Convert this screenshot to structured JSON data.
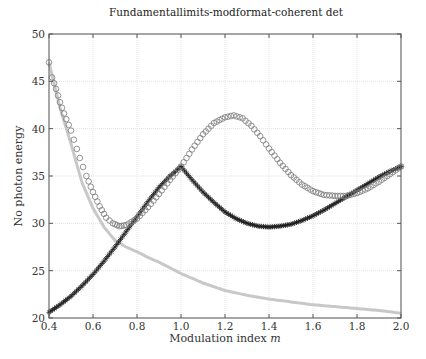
{
  "chart_data": {
    "type": "line",
    "title": "Fundamentallimits-modformat-coherent det",
    "xlabel": "Modulation index m",
    "xlabel_parts": {
      "text": "Modulation index ",
      "italic": "m"
    },
    "ylabel": "No photon energy",
    "xlim": [
      0.4,
      2.0
    ],
    "ylim": [
      20,
      50
    ],
    "xticks": [
      "0.4",
      "0.6",
      "0.8",
      "1.0",
      "1.2",
      "1.4",
      "1.6",
      "1.8",
      "2.0"
    ],
    "yticks": [
      "20",
      "25",
      "30",
      "35",
      "40",
      "45",
      "50"
    ],
    "grid": true,
    "legend": null,
    "series": [
      {
        "name": "circles (gray, open circle markers)",
        "marker": "circle",
        "color": "#7a7a7a",
        "x": [
          0.4,
          0.414,
          0.432,
          0.45,
          0.468,
          0.5,
          0.54,
          0.57,
          0.6,
          0.63,
          0.66,
          0.69,
          0.72,
          0.75,
          0.8,
          0.85,
          0.9,
          0.95,
          1.0,
          1.05,
          1.1,
          1.15,
          1.2,
          1.24,
          1.28,
          1.32,
          1.36,
          1.4,
          1.45,
          1.5,
          1.55,
          1.6,
          1.65,
          1.7,
          1.75,
          1.8,
          1.85,
          1.9,
          1.95,
          2.0
        ],
        "y": [
          47.0,
          45.4,
          44.2,
          42.8,
          41.6,
          39.8,
          36.9,
          35.0,
          33.3,
          31.8,
          30.6,
          30.0,
          29.7,
          29.8,
          30.5,
          31.7,
          33.1,
          34.6,
          36.0,
          37.8,
          39.4,
          40.6,
          41.2,
          41.4,
          41.1,
          40.3,
          39.2,
          37.9,
          36.4,
          35.1,
          34.1,
          33.4,
          33.0,
          32.9,
          32.9,
          33.2,
          33.7,
          34.4,
          35.2,
          36.0
        ]
      },
      {
        "name": "asterisks (black)",
        "marker": "asterisk",
        "color": "#1a1a1a",
        "x": [
          0.4,
          0.45,
          0.5,
          0.55,
          0.6,
          0.65,
          0.7,
          0.75,
          0.8,
          0.85,
          0.9,
          0.95,
          1.0,
          1.05,
          1.1,
          1.15,
          1.2,
          1.25,
          1.3,
          1.35,
          1.4,
          1.45,
          1.5,
          1.55,
          1.6,
          1.65,
          1.7,
          1.75,
          1.8,
          1.85,
          1.9,
          1.95,
          2.0
        ],
        "y": [
          20.6,
          21.4,
          22.3,
          23.4,
          24.6,
          26.0,
          27.5,
          29.1,
          30.7,
          32.3,
          33.8,
          35.0,
          36.0,
          34.6,
          33.3,
          32.2,
          31.2,
          30.5,
          30.0,
          29.7,
          29.6,
          29.7,
          29.9,
          30.3,
          30.8,
          31.4,
          32.1,
          32.8,
          33.5,
          34.2,
          34.9,
          35.5,
          36.0
        ]
      },
      {
        "name": "light gray line",
        "marker": "dot",
        "color": "#c8c8c8",
        "x": [
          0.4,
          0.45,
          0.5,
          0.55,
          0.6,
          0.65,
          0.7,
          0.75,
          0.8,
          0.85,
          0.9,
          1.0,
          1.1,
          1.2,
          1.3,
          1.4,
          1.5,
          1.6,
          1.7,
          1.8,
          1.9,
          2.0
        ],
        "y": [
          47.0,
          42.2,
          38.4,
          34.3,
          31.6,
          29.6,
          28.2,
          27.5,
          27.0,
          26.4,
          25.9,
          24.7,
          23.7,
          22.9,
          22.4,
          22.0,
          21.7,
          21.4,
          21.2,
          21.0,
          20.8,
          20.5
        ]
      }
    ]
  }
}
